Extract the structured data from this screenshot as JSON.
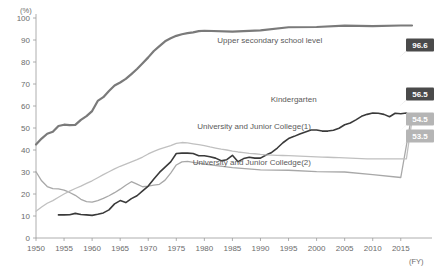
{
  "chart_data": {
    "type": "line",
    "title": "",
    "xlabel": "(FY)",
    "ylabel": "(%)",
    "ylim": [
      0,
      100
    ],
    "xlim": [
      1950,
      2017
    ],
    "grid": false,
    "legend_position": "inline-labels",
    "ytick_labels": [
      "0",
      "10",
      "20",
      "30",
      "40",
      "50",
      "60",
      "70",
      "80",
      "90",
      "100"
    ],
    "ytick_values": [
      0,
      10,
      20,
      30,
      40,
      50,
      60,
      70,
      80,
      90,
      100
    ],
    "xtick_labels": [
      "1950",
      "1955",
      "1960",
      "1965",
      "1970",
      "1975",
      "1980",
      "1985",
      "1990",
      "1995",
      "2000",
      "2005",
      "2010",
      "2015"
    ],
    "xtick_values": [
      1950,
      1955,
      1960,
      1965,
      1970,
      1975,
      1980,
      1985,
      1990,
      1995,
      2000,
      2005,
      2010,
      2015
    ],
    "series": [
      {
        "name": "Upper secondary school level",
        "color": "#7a7a7a",
        "width": 2.2,
        "label_x": 2001,
        "label_y": 88.5,
        "end_value": "96.6",
        "callout_style": "dark",
        "x": [
          1950,
          1951,
          1952,
          1953,
          1954,
          1955,
          1956,
          1957,
          1958,
          1959,
          1960,
          1961,
          1962,
          1963,
          1964,
          1965,
          1966,
          1967,
          1968,
          1969,
          1970,
          1971,
          1972,
          1973,
          1974,
          1975,
          1976,
          1977,
          1978,
          1979,
          1980,
          1985,
          1990,
          1995,
          2000,
          2005,
          2010,
          2015,
          2017
        ],
        "y": [
          42.5,
          45.2,
          47.4,
          48.3,
          50.9,
          51.5,
          51.3,
          51.4,
          53.7,
          55.4,
          57.7,
          62.3,
          64.0,
          66.8,
          69.3,
          70.7,
          72.3,
          74.5,
          76.8,
          79.4,
          82.1,
          85.0,
          87.2,
          89.4,
          90.8,
          91.9,
          92.6,
          93.1,
          93.5,
          94.0,
          94.2,
          93.8,
          94.4,
          95.8,
          95.9,
          96.5,
          96.3,
          96.6,
          96.6
        ]
      },
      {
        "name": "Kindergarten",
        "color": "#a8a8a8",
        "width": 1.3,
        "label_x": 2000,
        "label_y": 62.0,
        "end_value": "56.5",
        "callout_style": "dark",
        "x": [
          1950,
          1951,
          1952,
          1953,
          1954,
          1955,
          1956,
          1957,
          1958,
          1959,
          1960,
          1961,
          1962,
          1963,
          1964,
          1965,
          1966,
          1967,
          1968,
          1969,
          1970,
          1971,
          1972,
          1973,
          1974,
          1975,
          1976,
          1977,
          1978,
          1979,
          1980,
          1985,
          1990,
          1995,
          2000,
          2005,
          2010,
          2015,
          2017
        ],
        "y": [
          30.1,
          26.0,
          23.4,
          22.4,
          22.3,
          21.8,
          20.7,
          19.4,
          17.6,
          16.5,
          16.3,
          17.0,
          18.0,
          19.2,
          20.6,
          22.2,
          24.0,
          25.6,
          24.5,
          23.3,
          23.6,
          24.0,
          24.4,
          26.3,
          29.5,
          33.2,
          34.6,
          34.8,
          34.4,
          34.0,
          33.6,
          32.0,
          31.0,
          30.8,
          30.2,
          30.0,
          28.8,
          27.5,
          56.5
        ]
      },
      {
        "name": "University and Junior College(1)",
        "color": "#3a3a3a",
        "width": 1.6,
        "label_x": 1999,
        "label_y": 49.5,
        "end_value": "54.5",
        "callout_style": "light",
        "x": [
          1954,
          1955,
          1956,
          1957,
          1958,
          1959,
          1960,
          1961,
          1962,
          1963,
          1964,
          1965,
          1966,
          1967,
          1968,
          1969,
          1970,
          1971,
          1972,
          1973,
          1974,
          1975,
          1976,
          1977,
          1978,
          1979,
          1980,
          1981,
          1982,
          1983,
          1984,
          1985,
          1986,
          1987,
          1988,
          1989,
          1990,
          1991,
          1992,
          1993,
          1994,
          1995,
          1996,
          1997,
          1998,
          1999,
          2000,
          2001,
          2002,
          2003,
          2004,
          2005,
          2006,
          2007,
          2008,
          2009,
          2010,
          2011,
          2012,
          2013,
          2014,
          2015,
          2016,
          2017
        ],
        "y": [
          10.5,
          10.5,
          10.6,
          11.2,
          10.7,
          10.5,
          10.3,
          10.8,
          11.4,
          12.8,
          15.5,
          17.0,
          16.1,
          17.9,
          19.2,
          21.4,
          23.6,
          26.8,
          29.8,
          32.2,
          34.6,
          38.4,
          38.6,
          38.6,
          38.4,
          37.4,
          37.4,
          36.9,
          36.3,
          35.1,
          35.6,
          37.6,
          34.7,
          36.1,
          36.7,
          36.3,
          36.3,
          37.7,
          38.9,
          40.9,
          43.3,
          45.2,
          46.2,
          47.3,
          48.2,
          49.1,
          49.1,
          48.6,
          48.6,
          49.0,
          49.9,
          51.5,
          52.3,
          53.7,
          55.3,
          56.2,
          56.8,
          56.7,
          56.2,
          55.1,
          56.7,
          56.5,
          56.8,
          54.5
        ]
      },
      {
        "name": "University and Junior Colledge(2)",
        "color": "#c0c0c0",
        "width": 1.3,
        "label_x": 1999,
        "label_y": 33.0,
        "end_value": "53.5",
        "callout_style": "light",
        "x": [
          1950,
          1951,
          1952,
          1953,
          1954,
          1955,
          1956,
          1957,
          1958,
          1959,
          1960,
          1961,
          1962,
          1963,
          1964,
          1965,
          1966,
          1967,
          1968,
          1969,
          1970,
          1971,
          1972,
          1973,
          1974,
          1975,
          1976,
          1977,
          1978,
          1979,
          1980,
          1981,
          1982,
          1983,
          1984,
          1985,
          1986,
          1987,
          1988,
          1989,
          1990,
          1991,
          1992,
          1993,
          1994,
          1995,
          1996,
          1997,
          1998,
          1999,
          2000,
          2001,
          2002,
          2003,
          2004,
          2005,
          2006,
          2007,
          2008,
          2009,
          2010,
          2011,
          2012,
          2013,
          2014,
          2015,
          2016,
          2017
        ],
        "y": [
          12.2,
          14.1,
          15.8,
          17.0,
          18.5,
          20.0,
          21.3,
          22.5,
          23.6,
          24.8,
          26.0,
          27.4,
          28.8,
          30.1,
          31.4,
          32.6,
          33.6,
          34.6,
          35.6,
          36.8,
          38.2,
          39.4,
          40.4,
          41.2,
          42.0,
          43.0,
          43.4,
          43.2,
          42.8,
          42.4,
          42.0,
          41.4,
          40.9,
          40.4,
          40.0,
          39.5,
          39.1,
          38.8,
          38.5,
          38.3,
          38.0,
          37.8,
          37.7,
          37.6,
          37.5,
          37.4,
          37.3,
          37.2,
          37.1,
          37.0,
          36.9,
          36.8,
          36.7,
          36.6,
          36.5,
          36.4,
          36.3,
          36.2,
          36.1,
          36.0,
          36.0,
          36.0,
          36.0,
          36.0,
          36.0,
          36.0,
          36.0,
          53.5
        ]
      }
    ],
    "callouts": [
      {
        "value": "96.6",
        "style": "dark",
        "at_x": 420,
        "at_y": 45
      },
      {
        "value": "56.5",
        "style": "dark",
        "at_x": 420,
        "at_y": 94
      },
      {
        "value": "54.5",
        "style": "light",
        "at_x": 420,
        "at_y": 119
      },
      {
        "value": "53.5",
        "style": "light",
        "at_x": 420,
        "at_y": 136
      }
    ],
    "colors": {
      "callout_dark_bg": "#4a4a4a",
      "callout_dark_text": "#ffffff",
      "callout_light_bg": "#b5b5b5",
      "callout_light_text": "#ffffff",
      "axis": "#9a9a9a",
      "text": "#6b6b6b"
    }
  }
}
